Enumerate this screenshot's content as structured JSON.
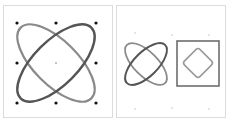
{
  "figure": {
    "panels": [
      {
        "id": "left",
        "description": "Two crossed ellipses with 3x3 grid of control points",
        "ellipses": [
          {
            "rotation": -45,
            "color": "#555555"
          },
          {
            "rotation": 45,
            "color": "#8a8a8a"
          }
        ],
        "control_points": 9
      },
      {
        "id": "right",
        "description": "Crossed ellipses beside a square containing a rounded diamond",
        "ellipses": [
          {
            "rotation": -45,
            "color": "#555555"
          },
          {
            "rotation": 45,
            "color": "#8a8a8a"
          }
        ],
        "square_color": "#6e6e6e",
        "diamond_color": "#9a9a9a"
      }
    ]
  }
}
